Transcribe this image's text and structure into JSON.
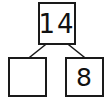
{
  "diagram": {
    "type": "number-bond",
    "title": "",
    "whole": {
      "label": "14",
      "filled": true
    },
    "parts": [
      {
        "label": "",
        "filled": false,
        "position": "left"
      },
      {
        "label": "8",
        "filled": true,
        "position": "right"
      }
    ],
    "connectors": [
      {
        "from": "whole",
        "to": "part-left",
        "x1": 45,
        "y1": 45,
        "x2": 30,
        "y2": 57
      },
      {
        "from": "whole",
        "to": "part-right",
        "x1": 69,
        "y1": 45,
        "x2": 84,
        "y2": 57
      }
    ],
    "colors": {
      "background": "#ffffff",
      "border": "#1a1a1a",
      "text": "#111111",
      "connector": "#1a1a1a"
    }
  }
}
